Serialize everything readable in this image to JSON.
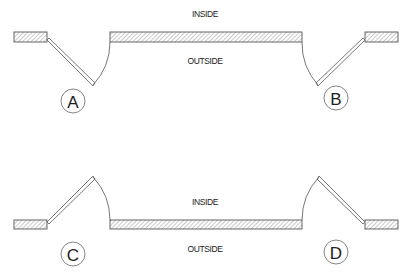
{
  "diagram": {
    "type": "door-swing-plan",
    "colors": {
      "line": "#555555",
      "text": "#222222",
      "background": "#ffffff"
    },
    "top": {
      "inside_label": "INSIDE",
      "outside_label": "OUTSIDE",
      "doors": [
        {
          "id": "A",
          "label": "A",
          "hinge": "left",
          "swing": "outward"
        },
        {
          "id": "B",
          "label": "B",
          "hinge": "right",
          "swing": "outward"
        }
      ]
    },
    "bottom": {
      "inside_label": "INSIDE",
      "outside_label": "OUTSIDE",
      "doors": [
        {
          "id": "C",
          "label": "C",
          "hinge": "left",
          "swing": "inward"
        },
        {
          "id": "D",
          "label": "D",
          "hinge": "right",
          "swing": "inward"
        }
      ]
    }
  }
}
